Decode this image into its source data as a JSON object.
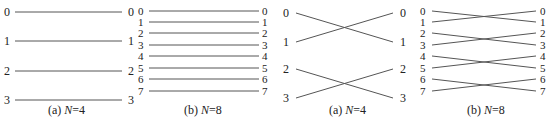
{
  "panels": [
    {
      "id": "a1",
      "caption_prefix": "(a) ",
      "caption_var": "N",
      "caption_eq": "=4",
      "n": 4,
      "type": "identity",
      "x0": 15,
      "x1": 122,
      "ys": [
        12,
        41,
        71,
        100
      ],
      "lx": 4,
      "rx": 128,
      "capx": 48,
      "capy": 111
    },
    {
      "id": "b1",
      "caption_prefix": "(b) ",
      "caption_var": "N",
      "caption_eq": "=8",
      "n": 8,
      "type": "identity",
      "x0": 149,
      "x1": 259,
      "ys": [
        11,
        22,
        33,
        45,
        56,
        68,
        79,
        91
      ],
      "lx": 138,
      "rx": 262,
      "capx": 184,
      "capy": 111
    },
    {
      "id": "a2",
      "caption_prefix": "(a) ",
      "caption_var": "N",
      "caption_eq": "=4",
      "n": 4,
      "type": "swap",
      "x0": 296,
      "x1": 393,
      "ys": [
        13,
        42,
        69,
        98
      ],
      "lx": 283,
      "rx": 400,
      "capx": 329,
      "capy": 111
    },
    {
      "id": "b2",
      "caption_prefix": "(b) ",
      "caption_var": "N",
      "caption_eq": "=8",
      "n": 8,
      "type": "swap",
      "x0": 432,
      "x1": 536,
      "ys": [
        11,
        22,
        33,
        45,
        56,
        68,
        79,
        91
      ],
      "lx": 420,
      "rx": 540,
      "capx": 467,
      "capy": 111
    }
  ],
  "colors": {
    "line": "#555555",
    "text": "#222222"
  }
}
